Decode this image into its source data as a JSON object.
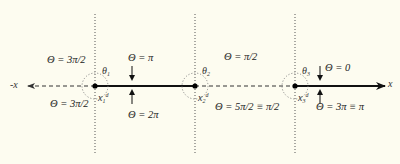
{
  "axis": {
    "positive_label": "x",
    "negative_label": "-x"
  },
  "nodes": [
    {
      "id": "x1",
      "x_label": "x",
      "x_sub": "1",
      "x_sup": "d",
      "theta_label": "θ",
      "theta_sub": "1"
    },
    {
      "id": "x2",
      "x_label": "x",
      "x_sub": "2",
      "x_sup": "d",
      "theta_label": "θ",
      "theta_sub": "2"
    },
    {
      "id": "x3",
      "x_label": "x",
      "x_sub": "3",
      "x_sup": "d",
      "theta_label": "θ",
      "theta_sub": "3"
    }
  ],
  "labels": {
    "left_top": "Θ = 3π/2",
    "left_bottom": "Θ = 3π/2",
    "seg1_top": "Θ = π",
    "seg1_bottom": "Θ = 2π",
    "seg2_top": "Θ = π/2",
    "seg2_bottom": "Θ = 5π/2 ≡ π/2",
    "seg3_top": "Θ = 0",
    "seg3_bottom": "Θ = 3π ≡ π"
  },
  "colors": {
    "background": "#fdfcf0",
    "ink": "#111111",
    "dotted": "#555555"
  }
}
